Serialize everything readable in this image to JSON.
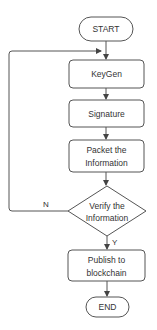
{
  "diagram": {
    "type": "flowchart",
    "colors": {
      "stroke": "#555555",
      "fill": "#ffffff",
      "text": "#333333"
    },
    "nodes": {
      "start": {
        "shape": "terminator",
        "label": "START"
      },
      "keygen": {
        "shape": "process",
        "label": "KeyGen"
      },
      "signature": {
        "shape": "process",
        "label": "Signature"
      },
      "packet": {
        "shape": "process",
        "line1": "Packet the",
        "line2": "Information"
      },
      "verify": {
        "shape": "decision",
        "line1": "Verify the",
        "line2": "Information"
      },
      "publish": {
        "shape": "process",
        "line1": "Publish to",
        "line2": "blockchain"
      },
      "end": {
        "shape": "terminator",
        "label": "END"
      }
    },
    "edges": {
      "no_label": "N",
      "yes_label": "Y"
    }
  }
}
